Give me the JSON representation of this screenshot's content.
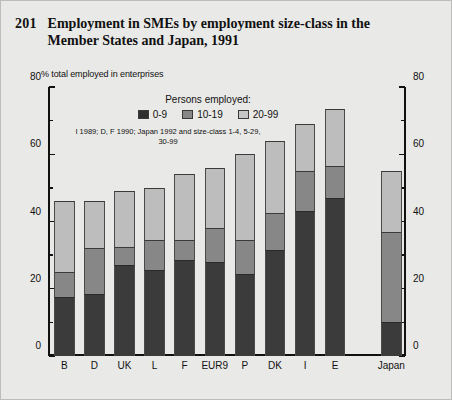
{
  "title": {
    "number": "201",
    "text": "Employment in SMEs by employment size-class in the Member States and Japan, 1991"
  },
  "legend": {
    "heading": "Persons employed:",
    "entries": [
      {
        "label": "0-9",
        "color": "#2f2f2f"
      },
      {
        "label": "10-19",
        "color": "#878787"
      },
      {
        "label": "20-99",
        "color": "#c6c6c6"
      }
    ]
  },
  "footnote": "I 1989; D, F 1990; Japan 1992 and size-class 1-4, 5-29, 30-99",
  "axis": {
    "y_title": "% total employed in enterprises",
    "major_ticks": [
      "0",
      "20",
      "40",
      "60",
      "80"
    ],
    "minor_ticks": [
      "10",
      "30",
      "50",
      "70"
    ]
  },
  "chart_data": {
    "type": "bar",
    "subtype": "stacked",
    "title": "Employment in SMEs by employment size-class in the Member States and Japan, 1991",
    "xlabel": "",
    "ylabel": "% total employed in enterprises",
    "ylim": [
      0,
      80
    ],
    "ytick_step": 20,
    "yminor_step": 10,
    "grid": false,
    "legend_position": "top-center",
    "categories": [
      "B",
      "D",
      "UK",
      "L",
      "F",
      "EUR9",
      "P",
      "DK",
      "I",
      "E",
      "Japan"
    ],
    "series": [
      {
        "name": "0-9",
        "color": "#2f2f2f",
        "values": [
          17.5,
          18.5,
          27.0,
          25.5,
          28.5,
          28.0,
          24.5,
          31.5,
          43.0,
          47.0,
          10.0
        ]
      },
      {
        "name": "10-19",
        "color": "#878787",
        "values": [
          7.5,
          13.5,
          5.5,
          9.0,
          6.0,
          10.0,
          10.0,
          11.0,
          12.0,
          9.5,
          27.0
        ]
      },
      {
        "name": "20-99",
        "color": "#c6c6c6",
        "values": [
          21.0,
          14.0,
          16.5,
          15.5,
          19.5,
          18.0,
          25.5,
          21.5,
          14.0,
          17.0,
          18.0
        ]
      }
    ],
    "totals": [
      46.0,
      46.0,
      49.0,
      50.0,
      54.0,
      56.0,
      60.0,
      64.0,
      69.0,
      73.5,
      55.0
    ]
  }
}
